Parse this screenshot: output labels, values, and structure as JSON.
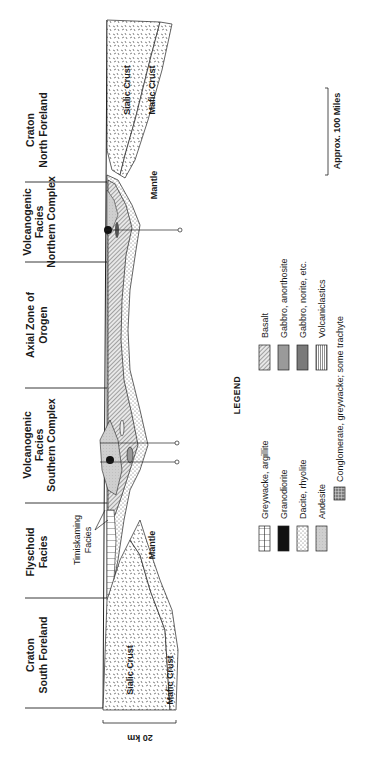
{
  "diagram": {
    "orientation": "rotated-90-ccw",
    "zones": [
      {
        "id": "craton-north",
        "line1": "Craton",
        "line2": "North Foreland"
      },
      {
        "id": "volcanogenic-north",
        "line1": "Volcanogenic",
        "line2": "Facies",
        "line3": "Northern Complex"
      },
      {
        "id": "axial-zone",
        "line1": "Axial Zone of",
        "line2": "Orogen"
      },
      {
        "id": "volcanogenic-south",
        "line1": "Volcanogenic",
        "line2": "Facies",
        "line3": "Southern Complex"
      },
      {
        "id": "flyschoid",
        "line1": "Flyschoid",
        "line2": "Facies"
      },
      {
        "id": "craton-south",
        "line1": "Craton",
        "line2": "South Foreland"
      }
    ],
    "layer_labels": {
      "sialic_crust_north": "Sialic Crust",
      "mafic_crust_north": "Mafic Crust",
      "mantle_north": "Mantle",
      "mantle_south": "Mantle",
      "sialic_crust_south": "Sialic Crust",
      "mafic_crust_south": "Mafic Crust",
      "timiskaming_line1": "Timiskaming",
      "timiskaming_line2": "Facies"
    },
    "scales": {
      "horizontal": "Approx. 100 Miles",
      "vertical": "20 km"
    }
  },
  "legend": {
    "title": "LEGEND",
    "items": [
      {
        "pattern": "vertical-ladder",
        "label": "Greywacke, argillite"
      },
      {
        "pattern": "solid-black",
        "label": "Granodiorite"
      },
      {
        "pattern": "fine-dots",
        "label": "Dacite, rhyolite"
      },
      {
        "pattern": "light-gray-stipple",
        "label": "Andesite"
      },
      {
        "pattern": "coarse-speckle",
        "label": "Conglomerate, greywacke; some trachyte"
      },
      {
        "pattern": "diagonal-hatch",
        "label": "Basalt"
      },
      {
        "pattern": "medium-gray",
        "label": "Gabbro, anorthosite"
      },
      {
        "pattern": "dark-gray",
        "label": "Gabbro, norite, etc."
      },
      {
        "pattern": "fine-vertical-lines",
        "label": "Volcaniclastics"
      }
    ]
  },
  "colors": {
    "ink": "#1a1a1a",
    "paper": "#ffffff",
    "gray_light": "#c8c8c8",
    "gray_medium": "#9a9a9a",
    "gray_dark": "#7a7a7a"
  }
}
